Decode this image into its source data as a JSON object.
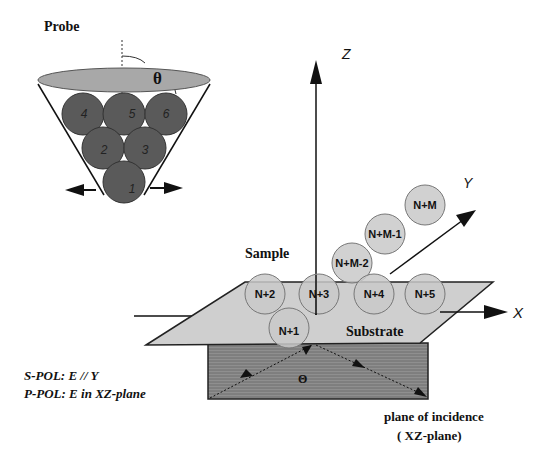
{
  "probe": {
    "title": "Probe",
    "angle_symbol": "θ",
    "spheres": [
      "1",
      "2",
      "3",
      "4",
      "5",
      "6"
    ]
  },
  "axes": {
    "z": "Z",
    "y": "Y",
    "x": "X"
  },
  "sample": {
    "title": "Sample",
    "substrate_label": "Substrate",
    "spheres": [
      "N+1",
      "N+2",
      "N+3",
      "N+4",
      "N+5",
      "N+M-2",
      "N+M-1",
      "N+M"
    ]
  },
  "incidence": {
    "angle_symbol": "Θ",
    "label_line1": "plane of incidence",
    "label_line2": "( XZ-plane)"
  },
  "polarization": {
    "s_pol": "S-POL: E // Y",
    "p_pol": "P-POL: E  in XZ-plane"
  },
  "colors": {
    "dark_sphere": "#5a5a5a",
    "light_sphere": "#c9c9c9",
    "substrate_top": "#cfcfcf",
    "substrate_side": "#8a8a8a",
    "probe_rim": "#a8a8a8",
    "line": "#1a1a1a"
  }
}
